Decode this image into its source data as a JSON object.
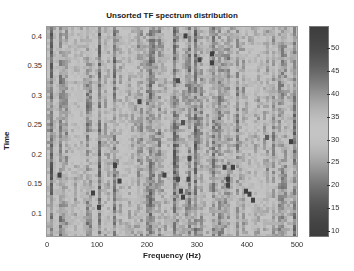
{
  "chart_data": {
    "type": "heatmap",
    "title": "Unsorted TF spectrum distribution",
    "xlabel": "Frequency (Hz)",
    "ylabel": "Time",
    "xlim": [
      0,
      500
    ],
    "ylim": [
      0.07,
      0.42
    ],
    "x_ticks": [
      0,
      100,
      200,
      300,
      400,
      500
    ],
    "y_ticks": [
      0.1,
      0.15,
      0.2,
      0.25,
      0.3,
      0.35,
      0.4
    ],
    "colorbar": {
      "range": [
        9,
        54
      ],
      "ticks": [
        10,
        15,
        20,
        25,
        30,
        35,
        40,
        45,
        50
      ],
      "colormap": "jet (rendered grayscale)"
    },
    "grid": false,
    "hot_spots": [
      {
        "freq": 25,
        "time": 0.172,
        "value": 52
      },
      {
        "freq": 92,
        "time": 0.142,
        "value": 52
      },
      {
        "freq": 104,
        "time": 0.118,
        "value": 52
      },
      {
        "freq": 136,
        "time": 0.188,
        "value": 52
      },
      {
        "freq": 145,
        "time": 0.162,
        "value": 52
      },
      {
        "freq": 235,
        "time": 0.172,
        "value": 52
      },
      {
        "freq": 185,
        "time": 0.295,
        "value": 51
      },
      {
        "freq": 262,
        "time": 0.33,
        "value": 50
      },
      {
        "freq": 277,
        "time": 0.405,
        "value": 52
      },
      {
        "freq": 305,
        "time": 0.365,
        "value": 52
      },
      {
        "freq": 330,
        "time": 0.375,
        "value": 53
      },
      {
        "freq": 330,
        "time": 0.36,
        "value": 53
      },
      {
        "freq": 272,
        "time": 0.26,
        "value": 48
      },
      {
        "freq": 285,
        "time": 0.2,
        "value": 50
      },
      {
        "freq": 355,
        "time": 0.185,
        "value": 52
      },
      {
        "freq": 372,
        "time": 0.185,
        "value": 52
      },
      {
        "freq": 362,
        "time": 0.165,
        "value": 52
      },
      {
        "freq": 362,
        "time": 0.155,
        "value": 52
      },
      {
        "freq": 398,
        "time": 0.145,
        "value": 53
      },
      {
        "freq": 405,
        "time": 0.14,
        "value": 53
      },
      {
        "freq": 412,
        "time": 0.13,
        "value": 52
      },
      {
        "freq": 268,
        "time": 0.145,
        "value": 52
      },
      {
        "freq": 272,
        "time": 0.135,
        "value": 52
      },
      {
        "freq": 262,
        "time": 0.165,
        "value": 50
      },
      {
        "freq": 283,
        "time": 0.165,
        "value": 50
      },
      {
        "freq": 488,
        "time": 0.228,
        "value": 52
      },
      {
        "freq": 440,
        "time": 0.235,
        "value": 46
      }
    ]
  },
  "title": "Unsorted TF spectrum distribution",
  "axes": {
    "xlabel": "Frequency (Hz)",
    "ylabel": "Time",
    "x_tick_labels": [
      "0",
      "100",
      "200",
      "300",
      "400",
      "500"
    ],
    "y_tick_labels": [
      "0.4",
      "0.35",
      "0.3",
      "0.25",
      "0.2",
      "0.15",
      "0.1"
    ],
    "colorbar_tick_labels": [
      "50",
      "45",
      "40",
      "35",
      "30",
      "25",
      "20",
      "15",
      "10"
    ]
  }
}
